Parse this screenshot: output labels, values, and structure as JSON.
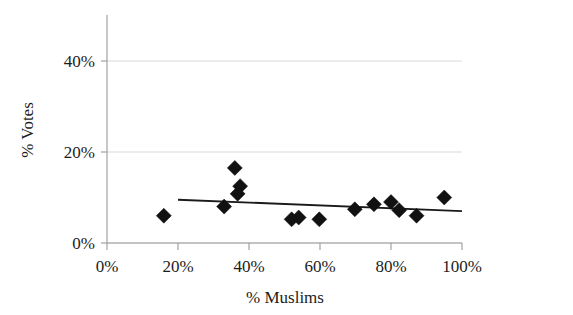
{
  "chart_data": {
    "type": "scatter",
    "title": "",
    "xlabel": "% Muslims",
    "ylabel": "% Votes",
    "xlim": [
      0,
      100
    ],
    "ylim": [
      0,
      45
    ],
    "x_ticks": [
      0,
      20,
      40,
      60,
      80,
      100
    ],
    "x_tick_labels": [
      "0%",
      "20%",
      "40%",
      "60%",
      "80%",
      "100%"
    ],
    "y_ticks": [
      0,
      20,
      40
    ],
    "y_tick_labels": [
      "0%",
      "20%",
      "40%"
    ],
    "grid": "horizontal",
    "legend": "none",
    "marker_style": "filled-diamond",
    "marker_color": "#111111",
    "points": [
      {
        "x": 16.0,
        "y": 6.0
      },
      {
        "x": 33.0,
        "y": 8.0
      },
      {
        "x": 36.0,
        "y": 16.5
      },
      {
        "x": 37.5,
        "y": 12.5
      },
      {
        "x": 36.8,
        "y": 10.8
      },
      {
        "x": 52.0,
        "y": 5.2
      },
      {
        "x": 54.0,
        "y": 5.6
      },
      {
        "x": 59.8,
        "y": 5.2
      },
      {
        "x": 69.8,
        "y": 7.4
      },
      {
        "x": 75.2,
        "y": 8.5
      },
      {
        "x": 80.0,
        "y": 9.0
      },
      {
        "x": 82.3,
        "y": 7.2
      },
      {
        "x": 87.2,
        "y": 6.0
      },
      {
        "x": 95.0,
        "y": 10.0
      }
    ],
    "trend_line": {
      "type": "linear",
      "x_start": 20.0,
      "y_start": 9.5,
      "x_end": 100.0,
      "y_end": 7.0
    }
  },
  "axes": {
    "y_tick_0": "0%",
    "y_tick_20": "20%",
    "y_tick_40": "40%",
    "x_tick_0": "0%",
    "x_tick_20": "20%",
    "x_tick_40": "40%",
    "x_tick_60": "60%",
    "x_tick_80": "80%",
    "x_tick_100": "100%",
    "x_axis_title": "% Muslims",
    "y_axis_title": "% Votes"
  }
}
